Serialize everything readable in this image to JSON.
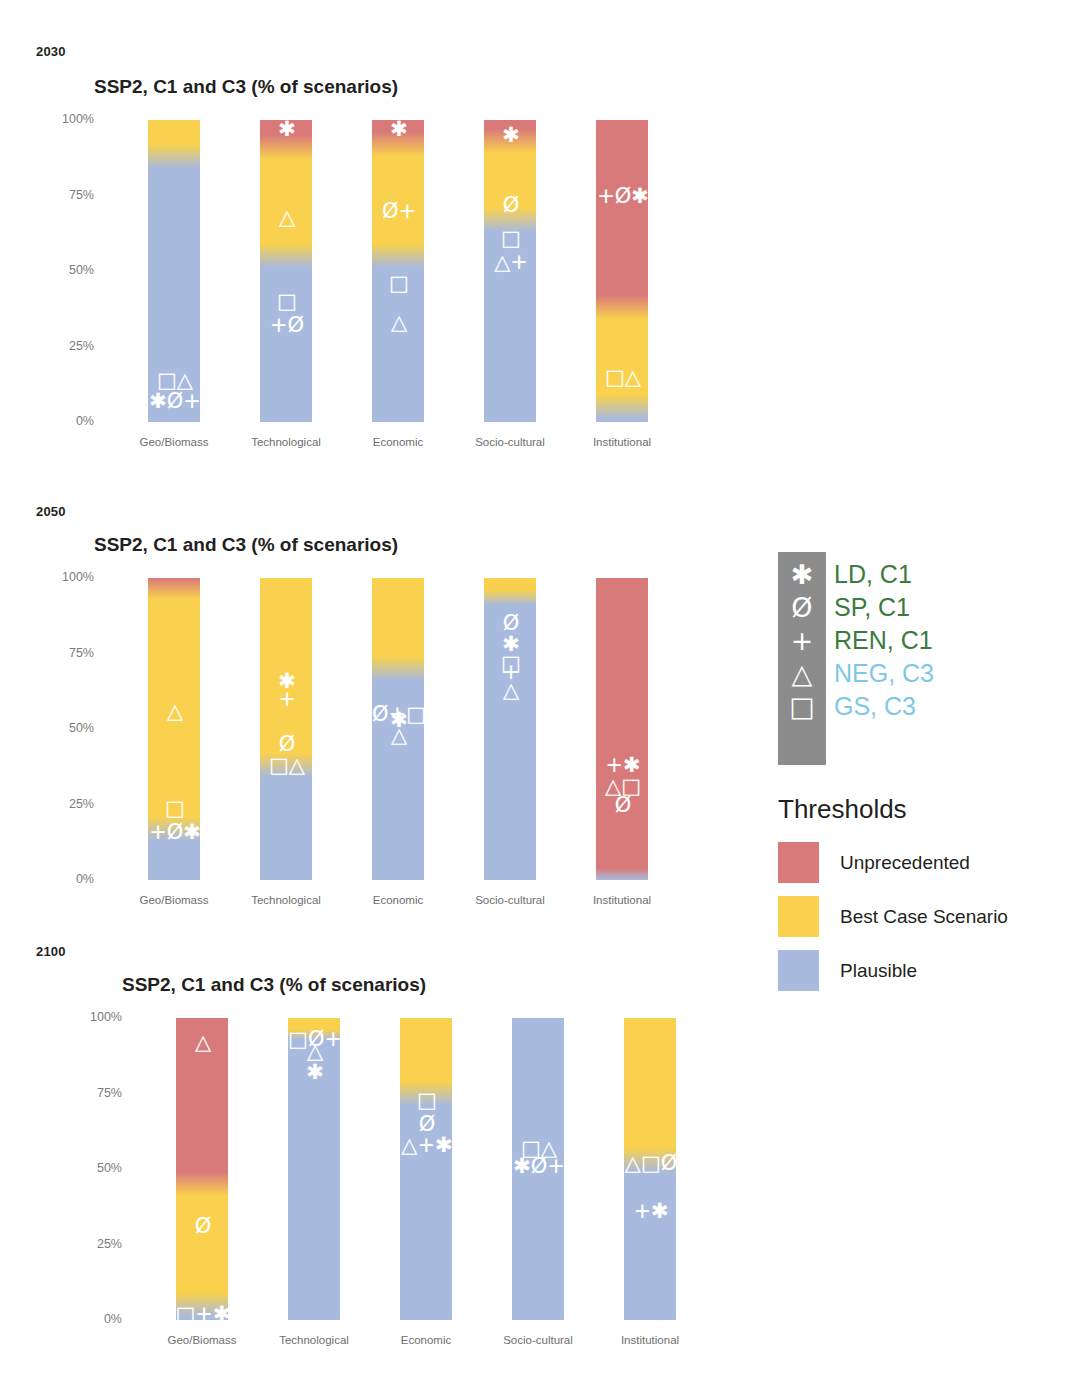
{
  "figure": {
    "panels": [
      {
        "year": "2030",
        "title": "SSP2, C1 and C3 (% of scenarios)",
        "y_ticks": [
          "100%",
          "75%",
          "50%",
          "25%",
          "0%"
        ]
      },
      {
        "year": "2050",
        "title": "SSP2, C1 and C3 (% of scenarios)",
        "y_ticks": [
          "100%",
          "75%",
          "50%",
          "25%",
          "0%"
        ]
      },
      {
        "year": "2100",
        "title": "SSP2, C1 and C3 (% of scenarios)",
        "y_ticks": [
          "100%",
          "75%",
          "50%",
          "25%",
          "0%"
        ]
      }
    ]
  },
  "legend": {
    "symbols": [
      {
        "glyph": "✱",
        "label": "LD, C1",
        "color": "#3d7a3d"
      },
      {
        "glyph": "Ø",
        "label": "SP, C1",
        "color": "#3d7a3d"
      },
      {
        "glyph": "+",
        "label": "REN, C1",
        "color": "#3d7a3d"
      },
      {
        "glyph": "△",
        "label": "NEG, C3",
        "color": "#7ec8e3"
      },
      {
        "glyph": "□",
        "label": "GS, C3",
        "color": "#7ec8e3"
      }
    ],
    "thresholds_title": "Thresholds",
    "thresholds": [
      {
        "label": "Unprecedented",
        "color": "#d97a7a"
      },
      {
        "label": "Best Case Scenario",
        "color": "#f9d14e"
      },
      {
        "label": "Plausible",
        "color": "#a8bade"
      }
    ]
  },
  "colors": {
    "unprecedented": "#d97a7a",
    "best_case": "#f9d14e",
    "plausible": "#a8bade",
    "symbol_box": "#8c8c8c",
    "c1_text": "#3d7a3d",
    "c3_text": "#7ec8e3",
    "axis_text": "#7b7b7b",
    "title_text": "#231f20"
  },
  "chart_data": [
    {
      "type": "bar",
      "title": "SSP2, C1 and C3 (% of scenarios)",
      "subtitle": "2030",
      "xlabel": "",
      "ylabel": "% of scenarios",
      "ylim": [
        0,
        100
      ],
      "yticks": [
        0,
        25,
        50,
        75,
        100
      ],
      "grid": false,
      "legend_position": "right",
      "categories": [
        "Geo/Biomass",
        "Technological",
        "Economic",
        "Socio-cultural",
        "Institutional"
      ],
      "series": [
        {
          "name": "Unprecedented",
          "values": [
            0,
            9,
            8,
            7,
            62
          ]
        },
        {
          "name": "Best Case Scenario",
          "values": [
            12,
            36,
            37,
            26,
            33
          ]
        },
        {
          "name": "Plausible",
          "values": [
            88,
            55,
            55,
            67,
            5
          ]
        }
      ],
      "annotations": [
        {
          "category": "Geo/Biomass",
          "glyphs": [
            "□",
            "△"
          ],
          "y": 14
        },
        {
          "category": "Geo/Biomass",
          "glyphs": [
            "✱",
            "Ø",
            "+"
          ],
          "y": 7
        },
        {
          "category": "Technological",
          "glyphs": [
            "✱"
          ],
          "y": 97
        },
        {
          "category": "Technological",
          "glyphs": [
            "△"
          ],
          "y": 68
        },
        {
          "category": "Technological",
          "glyphs": [
            "□"
          ],
          "y": 40
        },
        {
          "category": "Technological",
          "glyphs": [
            "+",
            "Ø"
          ],
          "y": 32
        },
        {
          "category": "Economic",
          "glyphs": [
            "✱"
          ],
          "y": 97
        },
        {
          "category": "Economic",
          "glyphs": [
            "Ø",
            "+"
          ],
          "y": 70
        },
        {
          "category": "Economic",
          "glyphs": [
            "□"
          ],
          "y": 46
        },
        {
          "category": "Economic",
          "glyphs": [
            "△"
          ],
          "y": 33
        },
        {
          "category": "Socio-cultural",
          "glyphs": [
            "✱"
          ],
          "y": 95
        },
        {
          "category": "Socio-cultural",
          "glyphs": [
            "Ø"
          ],
          "y": 72
        },
        {
          "category": "Socio-cultural",
          "glyphs": [
            "□"
          ],
          "y": 61
        },
        {
          "category": "Socio-cultural",
          "glyphs": [
            "△",
            "+"
          ],
          "y": 53
        },
        {
          "category": "Institutional",
          "glyphs": [
            "+",
            "Ø",
            "✱"
          ],
          "y": 75
        },
        {
          "category": "Institutional",
          "glyphs": [
            "□",
            "△"
          ],
          "y": 15
        }
      ]
    },
    {
      "type": "bar",
      "title": "SSP2, C1 and C3 (% of scenarios)",
      "subtitle": "2050",
      "xlabel": "",
      "ylabel": "% of scenarios",
      "ylim": [
        0,
        100
      ],
      "yticks": [
        0,
        25,
        50,
        75,
        100
      ],
      "grid": false,
      "legend_position": "right",
      "categories": [
        "Geo/Biomass",
        "Technological",
        "Economic",
        "Socio-cultural",
        "Institutional"
      ],
      "series": [
        {
          "name": "Unprecedented",
          "values": [
            3,
            0,
            0,
            0,
            100
          ]
        },
        {
          "name": "Best Case Scenario",
          "values": [
            80,
            62,
            30,
            5,
            0
          ]
        },
        {
          "name": "Plausible",
          "values": [
            17,
            38,
            70,
            95,
            0
          ]
        }
      ],
      "annotations": [
        {
          "category": "Geo/Biomass",
          "glyphs": [
            "△"
          ],
          "y": 56
        },
        {
          "category": "Geo/Biomass",
          "glyphs": [
            "□"
          ],
          "y": 24
        },
        {
          "category": "Geo/Biomass",
          "glyphs": [
            "+",
            "Ø",
            "✱"
          ],
          "y": 16
        },
        {
          "category": "Technological",
          "glyphs": [
            "✱"
          ],
          "y": 66
        },
        {
          "category": "Technological",
          "glyphs": [
            "+"
          ],
          "y": 60
        },
        {
          "category": "Technological",
          "glyphs": [
            "Ø"
          ],
          "y": 45
        },
        {
          "category": "Technological",
          "glyphs": [
            "□",
            "△"
          ],
          "y": 38
        },
        {
          "category": "Economic",
          "glyphs": [
            "Ø",
            "+",
            "□"
          ],
          "y": 55
        },
        {
          "category": "Economic",
          "glyphs": [
            "✱"
          ],
          "y": 53
        },
        {
          "category": "Economic",
          "glyphs": [
            "△"
          ],
          "y": 48
        },
        {
          "category": "Socio-cultural",
          "glyphs": [
            "Ø"
          ],
          "y": 85
        },
        {
          "category": "Socio-cultural",
          "glyphs": [
            "✱"
          ],
          "y": 78
        },
        {
          "category": "Socio-cultural",
          "glyphs": [
            "□"
          ],
          "y": 72
        },
        {
          "category": "Socio-cultural",
          "glyphs": [
            "+"
          ],
          "y": 69
        },
        {
          "category": "Socio-cultural",
          "glyphs": [
            "△"
          ],
          "y": 63
        },
        {
          "category": "Institutional",
          "glyphs": [
            "+",
            "✱"
          ],
          "y": 38
        },
        {
          "category": "Institutional",
          "glyphs": [
            "△",
            "□"
          ],
          "y": 31
        },
        {
          "category": "Institutional",
          "glyphs": [
            "Ø"
          ],
          "y": 25
        }
      ]
    },
    {
      "type": "bar",
      "title": "SSP2, C1 and C3 (% of scenarios)",
      "subtitle": "2100",
      "xlabel": "",
      "ylabel": "% of scenarios",
      "ylim": [
        0,
        100
      ],
      "yticks": [
        0,
        25,
        50,
        75,
        100
      ],
      "grid": false,
      "legend_position": "right",
      "categories": [
        "Geo/Biomass",
        "Technological",
        "Economic",
        "Socio-cultural",
        "Institutional"
      ],
      "series": [
        {
          "name": "Unprecedented",
          "values": [
            55,
            0,
            0,
            0,
            0
          ]
        },
        {
          "name": "Best Case Scenario",
          "values": [
            40,
            3,
            25,
            0,
            47
          ]
        },
        {
          "name": "Plausible",
          "values": [
            5,
            97,
            75,
            100,
            53
          ]
        }
      ],
      "annotations": [
        {
          "category": "Geo/Biomass",
          "glyphs": [
            "△"
          ],
          "y": 92
        },
        {
          "category": "Geo/Biomass",
          "glyphs": [
            "Ø"
          ],
          "y": 31
        },
        {
          "category": "Geo/Biomass",
          "glyphs": [
            "□",
            "+",
            "✱"
          ],
          "y": 2
        },
        {
          "category": "Technological",
          "glyphs": [
            "□",
            "Ø",
            "+"
          ],
          "y": 93
        },
        {
          "category": "Technological",
          "glyphs": [
            "△"
          ],
          "y": 89
        },
        {
          "category": "Technological",
          "glyphs": [
            "✱"
          ],
          "y": 82
        },
        {
          "category": "Economic",
          "glyphs": [
            "□"
          ],
          "y": 73
        },
        {
          "category": "Economic",
          "glyphs": [
            "Ø"
          ],
          "y": 65
        },
        {
          "category": "Economic",
          "glyphs": [
            "△",
            "+",
            "✱"
          ],
          "y": 58
        },
        {
          "category": "Socio-cultural",
          "glyphs": [
            "□",
            "△"
          ],
          "y": 57
        },
        {
          "category": "Socio-cultural",
          "glyphs": [
            "✱",
            "Ø",
            "+"
          ],
          "y": 51
        },
        {
          "category": "Institutional",
          "glyphs": [
            "△",
            "□",
            "Ø"
          ],
          "y": 52
        },
        {
          "category": "Institutional",
          "glyphs": [
            "+",
            "✱"
          ],
          "y": 36
        }
      ]
    }
  ]
}
